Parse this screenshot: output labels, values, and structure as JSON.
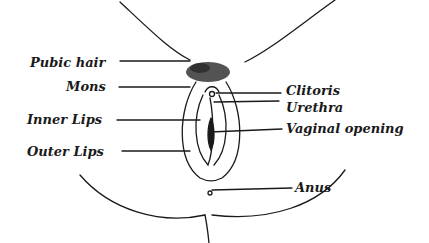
{
  "diagram": {
    "type": "anatomical-labeled-illustration",
    "labels_left": [
      {
        "text": "Pubic hair",
        "x": 30,
        "y": 57
      },
      {
        "text": "Mons",
        "x": 66,
        "y": 80
      },
      {
        "text": "Inner Lips",
        "x": 27,
        "y": 113
      },
      {
        "text": "Outer Lips",
        "x": 27,
        "y": 148
      }
    ],
    "labels_right": [
      {
        "text": "Clitoris",
        "x": 286,
        "y": 82
      },
      {
        "text": "Urethra",
        "x": 286,
        "y": 99
      },
      {
        "text": "Vaginal opening",
        "x": 286,
        "y": 121
      },
      {
        "text": "Anus",
        "x": 295,
        "y": 180
      }
    ],
    "colors": {
      "ink": "#1a1a1a",
      "background": "#ffffff"
    }
  }
}
